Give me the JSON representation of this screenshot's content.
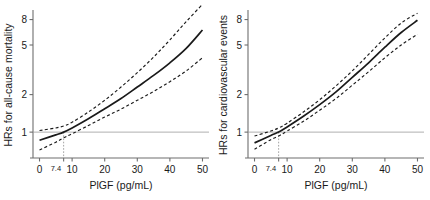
{
  "figure": {
    "panels": [
      {
        "id": "all-cause-mortality",
        "ylabel": "HRs for all-cause mortality",
        "xlabel": "PlGF (pg/mL)"
      },
      {
        "id": "cardiovascular-events",
        "ylabel": "HRs for cardiovascular events",
        "xlabel": "PlGF (pg/mL)"
      }
    ]
  },
  "chart_data": [
    {
      "type": "line",
      "title": "",
      "xlabel": "PlGF (pg/mL)",
      "ylabel": "HRs for all-cause mortality",
      "xlim": [
        -2,
        52
      ],
      "ylim": [
        0.62,
        9.2
      ],
      "yscale": "log",
      "xticks": [
        0,
        10,
        20,
        30,
        40,
        50
      ],
      "xticklabels": [
        "0",
        "10",
        "20",
        "30",
        "40",
        "50"
      ],
      "yticks": [
        1,
        2,
        5,
        8
      ],
      "yticklabels": [
        "1",
        "2",
        "5",
        "8"
      ],
      "grid": false,
      "legend": "none",
      "reference_line_y": 1,
      "reference_line_color": "#9a9a9a",
      "marker_x": 7.4,
      "marker_label": "7.4",
      "x": [
        0,
        5,
        7.4,
        10,
        15,
        20,
        25,
        30,
        35,
        40,
        45,
        50
      ],
      "series": [
        {
          "name": "Hazard ratio",
          "style": "solid",
          "color": "#1a1a1a",
          "values": [
            0.86,
            0.95,
            1.0,
            1.08,
            1.28,
            1.54,
            1.86,
            2.3,
            2.85,
            3.6,
            4.7,
            6.6
          ]
        },
        {
          "name": "Upper 95% CI",
          "style": "dashed",
          "color": "#1a1a1a",
          "values": [
            1.03,
            1.08,
            1.12,
            1.2,
            1.45,
            1.8,
            2.3,
            3.0,
            4.0,
            5.5,
            7.7,
            10.6
          ]
        },
        {
          "name": "Lower 95% CI",
          "style": "dashed",
          "color": "#1a1a1a",
          "values": [
            0.72,
            0.83,
            0.9,
            0.97,
            1.13,
            1.32,
            1.53,
            1.8,
            2.12,
            2.54,
            3.1,
            3.95
          ]
        }
      ]
    },
    {
      "type": "line",
      "title": "",
      "xlabel": "PlGF (pg/mL)",
      "ylabel": "HRs for cardiovascular events",
      "xlim": [
        -2,
        52
      ],
      "ylim": [
        0.62,
        9.2
      ],
      "yscale": "log",
      "xticks": [
        0,
        10,
        20,
        30,
        40,
        50
      ],
      "xticklabels": [
        "0",
        "10",
        "20",
        "30",
        "40",
        "50"
      ],
      "yticks": [
        1,
        2,
        5,
        8
      ],
      "yticklabels": [
        "1",
        "2",
        "5",
        "8"
      ],
      "grid": false,
      "legend": "none",
      "reference_line_y": 1,
      "reference_line_color": "#9a9a9a",
      "marker_x": 7.4,
      "marker_label": "7.4",
      "x": [
        0,
        5,
        7.4,
        10,
        15,
        20,
        25,
        30,
        35,
        40,
        45,
        50
      ],
      "series": [
        {
          "name": "Hazard ratio",
          "style": "solid",
          "color": "#1a1a1a",
          "values": [
            0.82,
            0.94,
            1.0,
            1.1,
            1.34,
            1.66,
            2.1,
            2.75,
            3.6,
            4.8,
            6.3,
            7.9
          ]
        },
        {
          "name": "Upper 95% CI",
          "style": "dashed",
          "color": "#1a1a1a",
          "values": [
            0.93,
            1.02,
            1.08,
            1.18,
            1.45,
            1.82,
            2.35,
            3.1,
            4.2,
            5.7,
            7.5,
            9.0
          ]
        },
        {
          "name": "Lower 95% CI",
          "style": "dashed",
          "color": "#1a1a1a",
          "values": [
            0.73,
            0.87,
            0.93,
            1.02,
            1.22,
            1.5,
            1.86,
            2.38,
            3.05,
            3.95,
            5.0,
            6.1
          ]
        }
      ]
    }
  ]
}
